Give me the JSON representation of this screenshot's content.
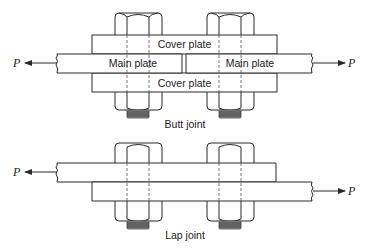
{
  "figure": {
    "butt_joint": {
      "caption": "Butt joint",
      "labels": {
        "cover_plate_top": "Cover plate",
        "cover_plate_bottom": "Cover plate",
        "main_plate_left": "Main plate",
        "main_plate_right": "Main plate",
        "force_left": "P",
        "force_right": "P"
      },
      "bolt_count": 2
    },
    "lap_joint": {
      "caption": "Lap joint",
      "labels": {
        "force_left": "P",
        "force_right": "P"
      },
      "bolt_count": 2
    }
  }
}
